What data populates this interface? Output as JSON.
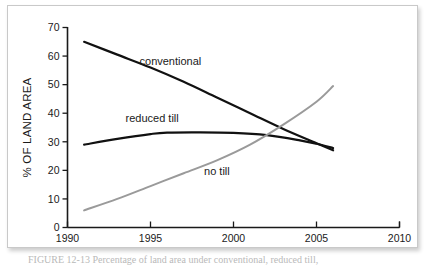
{
  "figure": {
    "caption_partial": "FIGURE 12-13   Percentage of land area under conventional, reduced till,"
  },
  "chart_data": {
    "type": "line",
    "title": "",
    "xlabel": "",
    "ylabel": "% OF LAND AREA",
    "xlim": [
      1990,
      2010
    ],
    "ylim": [
      0,
      70
    ],
    "xticks": [
      1990,
      1995,
      2000,
      2005,
      2010
    ],
    "yticks": [
      0,
      10,
      20,
      30,
      40,
      50,
      60,
      70
    ],
    "grid": false,
    "legend_position": "inline-annotations",
    "series": [
      {
        "name": "conventional",
        "color": "#111111",
        "label_x": 1996.2,
        "label_y": 57,
        "x": [
          1991,
          1993,
          1995,
          1997,
          1999,
          2001,
          2003,
          2005,
          2006
        ],
        "values": [
          65,
          60.5,
          56,
          51,
          45.5,
          40,
          34.5,
          29.5,
          27
        ]
      },
      {
        "name": "reduced till",
        "color": "#111111",
        "label_x": 1995.1,
        "label_y": 37,
        "x": [
          1991,
          1993,
          1995,
          1996,
          1998,
          2000,
          2002,
          2004,
          2005,
          2006
        ],
        "values": [
          29,
          31,
          32.7,
          33.2,
          33.3,
          33.1,
          32.3,
          30.5,
          29.3,
          27.8
        ]
      },
      {
        "name": "no till",
        "color": "#9a9a9a",
        "label_x": 1999.0,
        "label_y": 18.5,
        "x": [
          1991,
          1993,
          1995,
          1997,
          1999,
          2001,
          2003,
          2005,
          2006
        ],
        "values": [
          6,
          10,
          14.5,
          19,
          23.5,
          29,
          36,
          44,
          49.5
        ]
      }
    ]
  },
  "axis": {
    "y_title": "% OF LAND AREA",
    "y_tick_labels": [
      "0",
      "10",
      "20",
      "30",
      "40",
      "50",
      "60",
      "70"
    ],
    "x_tick_labels": [
      "1990",
      "1995",
      "2000",
      "2005",
      "2010"
    ]
  }
}
